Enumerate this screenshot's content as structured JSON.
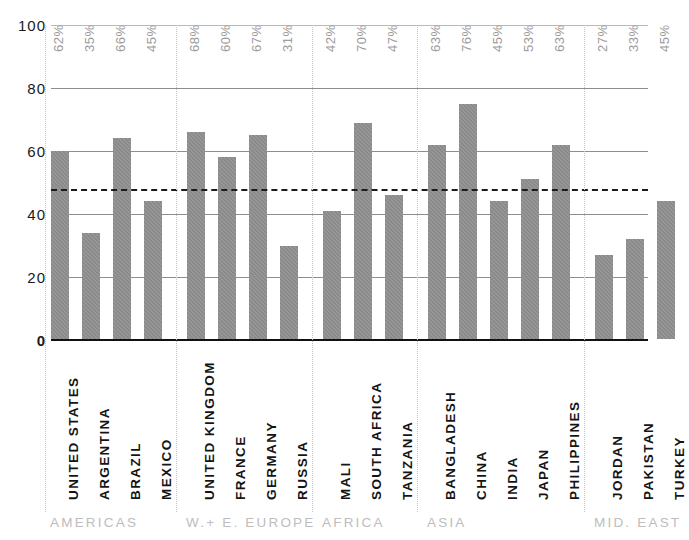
{
  "chart_data": {
    "type": "bar",
    "title": "",
    "xlabel": "",
    "ylabel": "",
    "ylim": [
      0,
      100
    ],
    "yticks": [
      0,
      20,
      40,
      60,
      80,
      100
    ],
    "grid": true,
    "legend": "none",
    "categories": [
      "UNITED STATES",
      "ARGENTINA",
      "BRAZIL",
      "MEXICO",
      "UNITED KINGDOM",
      "FRANCE",
      "GERMANY",
      "RUSSIA",
      "MALI",
      "SOUTH AFRICA",
      "TANZANIA",
      "BANGLADESH",
      "CHINA",
      "INDIA",
      "JAPAN",
      "PHILIPPINES",
      "JORDAN",
      "PAKISTAN",
      "TURKEY"
    ],
    "values": [
      60,
      34,
      64,
      44,
      66,
      58,
      65,
      30,
      41,
      69,
      46,
      62,
      75,
      44,
      51,
      62,
      27,
      32,
      44
    ],
    "data_labels": [
      "62%",
      "35%",
      "66%",
      "45%",
      "68%",
      "60%",
      "67%",
      "31%",
      "42%",
      "70%",
      "47%",
      "63%",
      "76%",
      "45%",
      "53%",
      "63%",
      "27%",
      "33%",
      "45%"
    ],
    "reference_line": {
      "value": 48,
      "style": "dashed"
    },
    "groups": [
      {
        "label": "AMERICAS",
        "count": 4
      },
      {
        "label": "W.+ E. EUROPE",
        "count": 4
      },
      {
        "label": "AFRICA",
        "count": 3
      },
      {
        "label": "ASIA",
        "count": 5
      },
      {
        "label": "MID. EAST",
        "count": 3
      }
    ],
    "colors": {
      "bar": "#8a8a8a",
      "axis": "#111111",
      "grid": "#8e8e8e",
      "data_label": "#9b9b9b",
      "group_label": "#bdbdbd",
      "reference_line": "#1b1b1b",
      "divider": "#c4c4c4"
    }
  }
}
